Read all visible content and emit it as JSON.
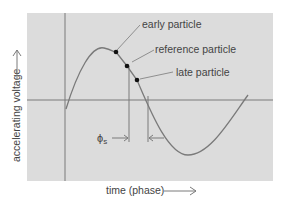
{
  "diagram": {
    "type": "phase-stability sinusoid",
    "background_color": "#dcdcdc",
    "curve_color": "#777777",
    "axis_color": "#7a7a7a",
    "labels": {
      "y_axis": "accelerating voltage",
      "x_axis": "time (phase)",
      "early": "early particle",
      "reference": "reference particle",
      "late": "late particle",
      "phase_symbol": "ϕ",
      "phase_subscript": "s"
    },
    "points": [
      {
        "name": "early",
        "x": 116,
        "y": 52
      },
      {
        "name": "reference",
        "x": 127,
        "y": 66
      },
      {
        "name": "late",
        "x": 137,
        "y": 80
      }
    ]
  }
}
